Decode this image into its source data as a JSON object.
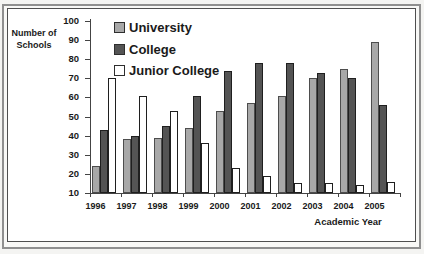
{
  "chart_data": {
    "type": "bar",
    "title": "",
    "ylabel": "Number of Schools",
    "xlabel": "Academic Year",
    "categories": [
      "1996",
      "1997",
      "1998",
      "1999",
      "2000",
      "2001",
      "2002",
      "2003",
      "2004",
      "2005"
    ],
    "series": [
      {
        "name": "University",
        "color": "#a8a8a8",
        "border": "#4d4d4d",
        "values": [
          24,
          38,
          39,
          44,
          53,
          57,
          61,
          70,
          75,
          89
        ]
      },
      {
        "name": "College",
        "color": "#545454",
        "border": "#1f1f1f",
        "values": [
          43,
          40,
          45,
          61,
          74,
          78,
          78,
          73,
          70,
          56
        ]
      },
      {
        "name": "Junior College",
        "color": "#ffffff",
        "border": "#1f1f1f",
        "values": [
          70,
          61,
          53,
          36,
          23,
          19,
          15,
          15,
          14,
          16
        ]
      }
    ],
    "ylim": [
      10,
      100
    ],
    "yticks": [
      10,
      20,
      30,
      40,
      50,
      60,
      70,
      80,
      90,
      100
    ],
    "grid": false,
    "legend_position": "top-center-vertical",
    "axis_color": "#444444",
    "background_color": "#ffffff"
  }
}
